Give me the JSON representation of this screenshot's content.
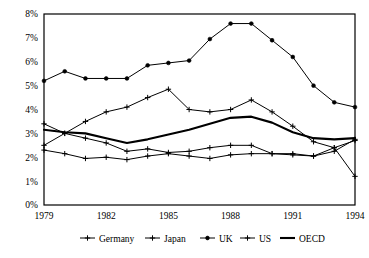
{
  "chart_data": {
    "type": "line",
    "title": "",
    "subtitle": "",
    "xlabel": "",
    "ylabel": "",
    "x": [
      1979,
      1980,
      1981,
      1982,
      1983,
      1984,
      1985,
      1986,
      1987,
      1988,
      1989,
      1990,
      1991,
      1992,
      1993,
      1994
    ],
    "xlim": [
      1979,
      1994
    ],
    "ylim": [
      0,
      8
    ],
    "ytick_labels": [
      "0%",
      "1%",
      "2%",
      "3%",
      "4%",
      "5%",
      "6%",
      "7%",
      "8%"
    ],
    "ytick_values": [
      0,
      1,
      2,
      3,
      4,
      5,
      6,
      7,
      8
    ],
    "xtick_labels": [
      "1979",
      "1982",
      "1985",
      "1988",
      "1991",
      "1994"
    ],
    "xtick_values": [
      1979,
      1982,
      1985,
      1988,
      1991,
      1994
    ],
    "grid": false,
    "legend_position": "bottom",
    "series": [
      {
        "name": "Germany",
        "marker": "plus",
        "line_weight": "thin",
        "values": [
          2.3,
          2.15,
          1.95,
          2.0,
          1.9,
          2.05,
          2.15,
          2.05,
          1.95,
          2.1,
          2.15,
          2.15,
          2.15,
          2.05,
          2.4,
          2.7
        ]
      },
      {
        "name": "Japan",
        "marker": "plus",
        "line_weight": "thin",
        "values": [
          2.5,
          3.0,
          2.8,
          2.6,
          2.25,
          2.35,
          2.2,
          2.25,
          2.4,
          2.5,
          2.5,
          2.15,
          2.1,
          2.05,
          2.25,
          2.75
        ]
      },
      {
        "name": "UK",
        "marker": "dot",
        "line_weight": "thin",
        "values": [
          5.2,
          5.6,
          5.3,
          5.3,
          5.3,
          5.85,
          5.95,
          6.05,
          6.95,
          7.6,
          7.6,
          6.9,
          6.2,
          5.0,
          4.3,
          4.1
        ]
      },
      {
        "name": "US",
        "marker": "plus",
        "line_weight": "thin",
        "values": [
          3.4,
          3.0,
          3.5,
          3.9,
          4.1,
          4.5,
          4.85,
          4.0,
          3.9,
          4.0,
          4.4,
          3.9,
          3.3,
          2.65,
          2.4,
          1.2
        ]
      },
      {
        "name": "OECD",
        "marker": "none",
        "line_weight": "thick",
        "values": [
          3.15,
          3.05,
          3.0,
          2.8,
          2.6,
          2.75,
          2.95,
          3.15,
          3.4,
          3.65,
          3.7,
          3.45,
          3.05,
          2.8,
          2.75,
          2.8
        ]
      }
    ]
  },
  "legend": {
    "items": [
      {
        "label": "Germany",
        "marker": "plus"
      },
      {
        "label": "Japan",
        "marker": "plus"
      },
      {
        "label": "UK",
        "marker": "dot"
      },
      {
        "label": "US",
        "marker": "plus"
      },
      {
        "label": "OECD",
        "marker": "line"
      }
    ]
  },
  "colors": {
    "line": "#000000",
    "frame": "#000000",
    "background": "#ffffff",
    "text": "#000000"
  }
}
